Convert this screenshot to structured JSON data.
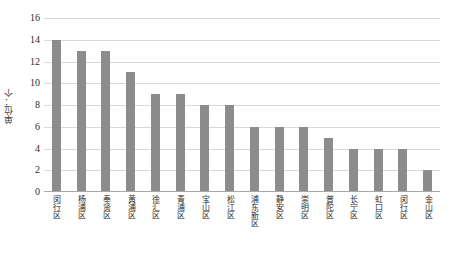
{
  "chart_data": {
    "type": "bar",
    "title": "",
    "xlabel": "",
    "ylabel": "单位：个",
    "ylim": [
      0,
      16
    ],
    "ytick_step": 2,
    "grid": true,
    "legend": "none",
    "bar_color": "#8c8c8c",
    "gridline_color": "#d9d9d9",
    "yticks": [
      "16",
      "14",
      "12",
      "10",
      "8",
      "6",
      "4",
      "2",
      "0"
    ],
    "categories": [
      "闵行区",
      "杨浦区",
      "奉贤区",
      "黄浦区",
      "徐汇区",
      "青浦区",
      "宝山区",
      "松江区",
      "浦东新区",
      "静安区",
      "崇明区",
      "普陀区",
      "长宁区",
      "虹口区",
      "闵行区",
      "金山区"
    ],
    "values": [
      14,
      13,
      13,
      11,
      9,
      9,
      8,
      8,
      6,
      6,
      6,
      5,
      4,
      4,
      4,
      2
    ]
  }
}
